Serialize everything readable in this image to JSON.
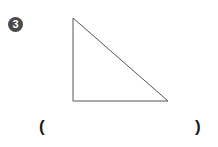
{
  "problem": {
    "number": "3",
    "shape": "right-triangle",
    "open_paren": "(",
    "close_paren": ")",
    "answer": ""
  },
  "figure": {
    "stroke_color": "#555555",
    "vertices": {
      "top": [
        73,
        18
      ],
      "bottom_left": [
        73,
        101
      ],
      "bottom_right": [
        168,
        101
      ]
    }
  }
}
